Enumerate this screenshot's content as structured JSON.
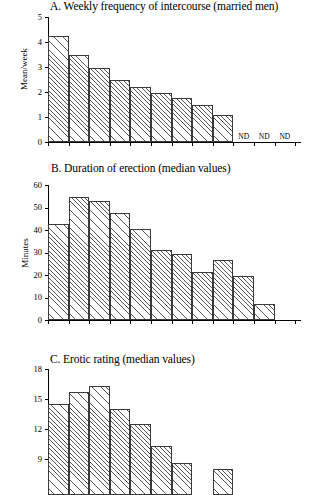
{
  "chart_data": [
    {
      "type": "bar",
      "panel": "A",
      "title": "A. Weekly frequency of intercourse (married men)",
      "xlabel": "",
      "ylabel": "Mean/week",
      "ylim": [
        0,
        5
      ],
      "yticks": [
        0,
        1,
        2,
        3,
        4,
        5
      ],
      "ytick_labels": [
        "0",
        "1",
        "2",
        "3",
        "4",
        "5"
      ],
      "grid": false,
      "legend": "none",
      "n_slots": 12,
      "values": [
        4.25,
        3.5,
        2.95,
        2.5,
        2.2,
        1.95,
        1.75,
        1.5,
        1.1,
        null,
        null,
        null
      ],
      "annotations": [
        {
          "slot": 9,
          "text": "ND"
        },
        {
          "slot": 10,
          "text": "ND"
        },
        {
          "slot": 11,
          "text": "ND"
        }
      ]
    },
    {
      "type": "bar",
      "panel": "B",
      "title": "B. Duration of erection (median values)",
      "xlabel": "",
      "ylabel": "Minutes",
      "ylim": [
        0,
        60
      ],
      "yticks": [
        0,
        10,
        20,
        30,
        40,
        50,
        60
      ],
      "ytick_labels": [
        "0",
        "10",
        "20",
        "30",
        "40",
        "50",
        "60"
      ],
      "grid": false,
      "legend": "none",
      "n_slots": 12,
      "values": [
        42.5,
        54.5,
        53.0,
        47.5,
        40.5,
        31.0,
        29.5,
        21.5,
        26.5,
        19.5,
        7.0,
        null
      ],
      "annotations": []
    },
    {
      "type": "bar",
      "panel": "C",
      "title": "C. Erotic rating (median values)",
      "xlabel": "",
      "ylabel": "",
      "ylim": [
        6,
        18
      ],
      "yticks": [
        9,
        12,
        15,
        18
      ],
      "ytick_labels": [
        "9",
        "12",
        "15",
        "18"
      ],
      "grid": false,
      "legend": "none",
      "cropped": true,
      "n_slots": 12,
      "values": [
        14.5,
        15.7,
        16.3,
        14.0,
        12.5,
        10.3,
        8.6,
        null,
        8.0,
        null,
        null,
        null
      ],
      "annotations": []
    }
  ]
}
